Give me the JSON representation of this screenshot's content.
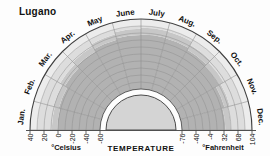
{
  "title": "Lugano",
  "chart_data": {
    "type": "radial-temperature-wheel",
    "title": "Lugano",
    "axis_label_center": "TEMPERATURE",
    "celsius": {
      "label": "°Celsius",
      "ticks": [
        40,
        20,
        0,
        -20,
        -40,
        -60
      ]
    },
    "fahrenheit": {
      "label": "°Fahrenheit",
      "ticks": [
        -76,
        -40,
        -4,
        32,
        68,
        104
      ]
    },
    "scale_c": {
      "min": -60,
      "max": 40,
      "grid_step_c": 10,
      "sector_step_deg": 15
    },
    "months": [
      {
        "name": "Jan.",
        "band_top_c": 1,
        "rim_top_c": 9
      },
      {
        "name": "Feb.",
        "band_top_c": 3,
        "rim_top_c": 11
      },
      {
        "name": "Mar.",
        "band_top_c": 7,
        "rim_top_c": 15
      },
      {
        "name": "Apr.",
        "band_top_c": 11,
        "rim_top_c": 19
      },
      {
        "name": "May",
        "band_top_c": 15,
        "rim_top_c": 23
      },
      {
        "name": "June",
        "band_top_c": 17,
        "rim_top_c": 26
      },
      {
        "name": "July",
        "band_top_c": 18,
        "rim_top_c": 28
      },
      {
        "name": "Aug.",
        "band_top_c": 17,
        "rim_top_c": 27
      },
      {
        "name": "Sep.",
        "band_top_c": 14,
        "rim_top_c": 22
      },
      {
        "name": "Oct.",
        "band_top_c": 10,
        "rim_top_c": 18
      },
      {
        "name": "Nov.",
        "band_top_c": 5,
        "rim_top_c": 13
      },
      {
        "name": "Dec.",
        "band_top_c": 2,
        "rim_top_c": 10
      }
    ],
    "colors": {
      "dark_band": "#b2b2b2",
      "rim_band": "#c7c7c7",
      "base_field": "#dddddd",
      "outer_field": "#ececec",
      "center_disc": "#d4d4d4",
      "grid_line": "#8f8f8f",
      "frame_line": "#3f3f3f",
      "text": "#111111"
    }
  }
}
